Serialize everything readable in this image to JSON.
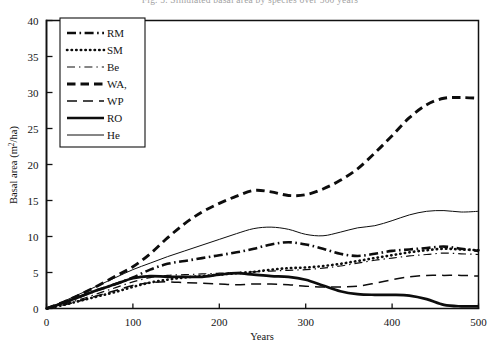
{
  "figure": {
    "caption_partial": "Fig. 5. Simulated basal area by species over 500 years",
    "xlabel": "Years",
    "ylabel": "Basal area (m²/ha)",
    "ylabel_main": "Basal area (m",
    "ylabel_sup": "2",
    "ylabel_tail": "/ha)"
  },
  "chart_data": {
    "type": "line",
    "title": "",
    "xlabel": "Years",
    "ylabel": "Basal area (m2/ha)",
    "xlim": [
      0,
      500
    ],
    "ylim": [
      0,
      40
    ],
    "xticks": [
      0,
      100,
      200,
      300,
      400,
      500
    ],
    "yticks": [
      0,
      5,
      10,
      15,
      20,
      25,
      30,
      35,
      40
    ],
    "grid": false,
    "legend_position": "top-left-inside",
    "line_color": "#0d0d0d",
    "x": [
      0,
      20,
      40,
      60,
      80,
      100,
      120,
      140,
      160,
      180,
      200,
      220,
      240,
      260,
      280,
      300,
      320,
      340,
      360,
      380,
      400,
      420,
      440,
      460,
      480,
      500
    ],
    "series": [
      {
        "name": "RM",
        "label": "RM",
        "style": "dash-dot",
        "width": 2.6,
        "values": [
          0.0,
          0.8,
          1.7,
          2.6,
          3.4,
          4.3,
          5.4,
          6.2,
          6.6,
          7.0,
          7.4,
          7.8,
          8.3,
          8.9,
          9.2,
          8.9,
          8.3,
          7.6,
          7.3,
          7.6,
          8.0,
          8.2,
          8.4,
          8.6,
          8.3,
          8.0
        ]
      },
      {
        "name": "SM",
        "label": "SM",
        "style": "dotted",
        "width": 2.6,
        "values": [
          0.0,
          0.5,
          1.1,
          1.7,
          2.3,
          3.0,
          3.6,
          4.0,
          4.3,
          4.5,
          4.7,
          4.9,
          5.1,
          5.4,
          5.6,
          5.7,
          5.9,
          6.2,
          6.6,
          7.0,
          7.4,
          7.8,
          8.1,
          8.3,
          8.2,
          8.1
        ]
      },
      {
        "name": "Be",
        "label": "Be",
        "style": "thin-dash-dot",
        "width": 1.2,
        "values": [
          0.0,
          0.6,
          1.3,
          2.1,
          2.9,
          3.7,
          4.3,
          4.6,
          4.7,
          4.8,
          4.9,
          5.0,
          5.1,
          5.2,
          5.3,
          5.4,
          5.6,
          5.9,
          6.3,
          6.7,
          7.0,
          7.3,
          7.5,
          7.7,
          7.6,
          7.5
        ]
      },
      {
        "name": "WA,",
        "label": "WA,",
        "style": "dashed-thick",
        "width": 2.9,
        "values": [
          0.0,
          0.9,
          2.0,
          3.2,
          4.5,
          5.8,
          7.6,
          9.8,
          11.8,
          13.4,
          14.6,
          15.6,
          16.4,
          16.2,
          15.7,
          15.8,
          16.6,
          17.8,
          19.4,
          21.6,
          24.0,
          26.5,
          28.3,
          29.2,
          29.3,
          29.2
        ]
      },
      {
        "name": "WP",
        "label": "WP",
        "style": "long-dash",
        "width": 1.5,
        "values": [
          0.0,
          0.5,
          1.1,
          1.8,
          2.5,
          3.2,
          3.6,
          3.7,
          3.6,
          3.5,
          3.4,
          3.3,
          3.4,
          3.4,
          3.3,
          3.1,
          3.0,
          3.0,
          3.1,
          3.5,
          4.0,
          4.4,
          4.6,
          4.6,
          4.6,
          4.5
        ]
      },
      {
        "name": "RO",
        "label": "RO",
        "style": "solid-thick",
        "width": 2.7,
        "values": [
          0.0,
          0.8,
          1.7,
          2.6,
          3.4,
          4.2,
          4.5,
          4.4,
          4.4,
          4.4,
          4.7,
          4.9,
          4.7,
          4.5,
          4.4,
          4.0,
          3.2,
          2.4,
          2.0,
          1.9,
          1.9,
          1.8,
          1.3,
          0.5,
          0.3,
          0.3
        ]
      },
      {
        "name": "He",
        "label": "He",
        "style": "solid-thin",
        "width": 1.0,
        "values": [
          0.0,
          1.0,
          2.1,
          3.2,
          4.3,
          5.4,
          6.3,
          7.2,
          8.0,
          8.8,
          9.6,
          10.4,
          11.1,
          11.3,
          11.0,
          10.3,
          10.1,
          10.6,
          11.2,
          11.5,
          12.2,
          13.0,
          13.5,
          13.6,
          13.4,
          13.5
        ]
      }
    ]
  },
  "legend": {
    "items": [
      {
        "label": "RM"
      },
      {
        "label": "SM"
      },
      {
        "label": "Be"
      },
      {
        "label": "WA,"
      },
      {
        "label": "WP"
      },
      {
        "label": "RO"
      },
      {
        "label": "He"
      }
    ]
  },
  "axes": {
    "x_tick_labels": [
      "0",
      "100",
      "200",
      "300",
      "400",
      "500"
    ],
    "y_tick_labels": [
      "0",
      "5",
      "10",
      "15",
      "20",
      "25",
      "30",
      "35",
      "40"
    ]
  }
}
